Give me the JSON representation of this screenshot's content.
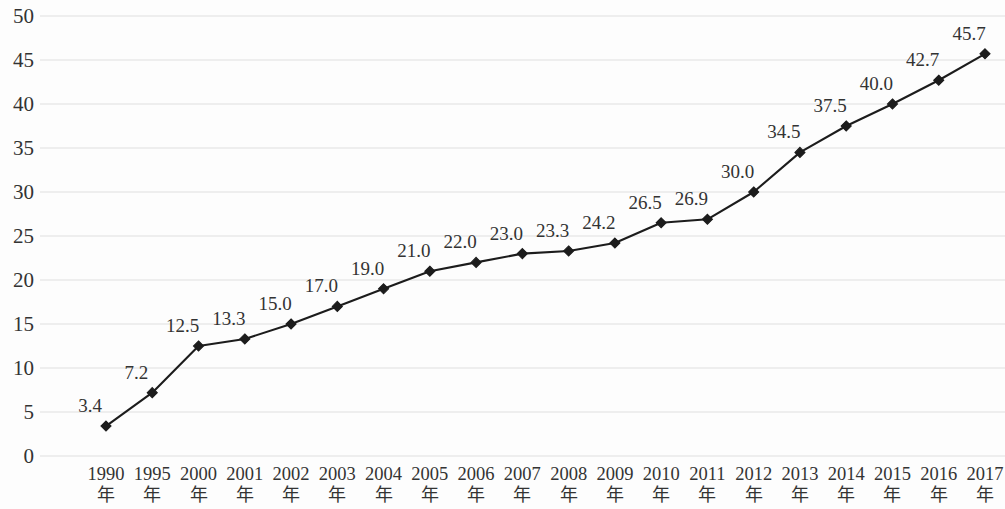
{
  "chart_data": {
    "type": "line",
    "title": "",
    "xlabel": "",
    "ylabel": "",
    "categories": [
      "1990年",
      "1995年",
      "2000年",
      "2001年",
      "2002年",
      "2003年",
      "2004年",
      "2005年",
      "2006年",
      "2007年",
      "2008年",
      "2009年",
      "2010年",
      "2011年",
      "2012年",
      "2013年",
      "2014年",
      "2015年",
      "2016年",
      "2017年"
    ],
    "category_years": [
      "1990",
      "1995",
      "2000",
      "2001",
      "2002",
      "2003",
      "2004",
      "2005",
      "2006",
      "2007",
      "2008",
      "2009",
      "2010",
      "2011",
      "2012",
      "2013",
      "2014",
      "2015",
      "2016",
      "2017"
    ],
    "category_unit": "年",
    "values": [
      3.4,
      7.2,
      12.5,
      13.3,
      15.0,
      17.0,
      19.0,
      21.0,
      22.0,
      23.0,
      23.3,
      24.2,
      26.5,
      26.9,
      30.0,
      34.5,
      37.5,
      40.0,
      42.7,
      45.7
    ],
    "data_labels": [
      "3.4",
      "7.2",
      "12.5",
      "13.3",
      "15.0",
      "17.0",
      "19.0",
      "21.0",
      "22.0",
      "23.0",
      "23.3",
      "24.2",
      "26.5",
      "26.9",
      "30.0",
      "34.5",
      "37.5",
      "40.0",
      "42.7",
      "45.7"
    ],
    "ylim": [
      0,
      50
    ],
    "ytick_step": 5,
    "ytick_labels": [
      "0",
      "5",
      "10",
      "15",
      "20",
      "25",
      "30",
      "35",
      "40",
      "45",
      "50"
    ],
    "grid": true,
    "grid_axis": "y",
    "legend": "none",
    "series_color": "#1c1c1c",
    "grid_color": "#e9e9e9",
    "background_color": "#fdfdfd",
    "marker": "diamond"
  }
}
